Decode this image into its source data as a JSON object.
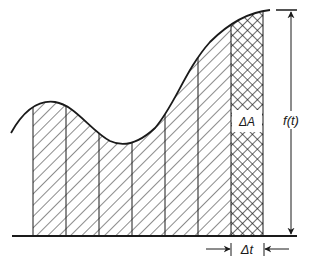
{
  "figure": {
    "labels": {
      "delta_area": "ΔA",
      "function": "f(t)",
      "delta_t": "Δt"
    },
    "colors": {
      "ink": "#1a1a1a",
      "background": "#ffffff"
    },
    "strips": {
      "hatched_count": 6,
      "crosshatched_count": 1
    }
  }
}
